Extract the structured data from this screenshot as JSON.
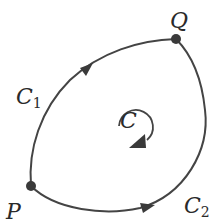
{
  "diagram": {
    "stroke_color": "#444444",
    "point_color": "#3a3a3a",
    "labels": {
      "P": "P",
      "Q": "Q",
      "C1_main": "C",
      "C1_sub": "1",
      "C2_main": "C",
      "C2_sub": "2",
      "C": "C"
    },
    "points": [
      {
        "name": "P",
        "x": 31,
        "y": 186
      },
      {
        "name": "Q",
        "x": 176,
        "y": 39
      }
    ],
    "paths": [
      {
        "name": "C1",
        "from": "P",
        "to": "Q",
        "side": "upper-left",
        "arrow_direction": "toward Q"
      },
      {
        "name": "C2",
        "from": "P",
        "to": "Q",
        "side": "lower-right",
        "arrow_direction": "toward Q"
      }
    ],
    "orientation_indicator": {
      "label": "C",
      "direction": "clockwise"
    }
  }
}
